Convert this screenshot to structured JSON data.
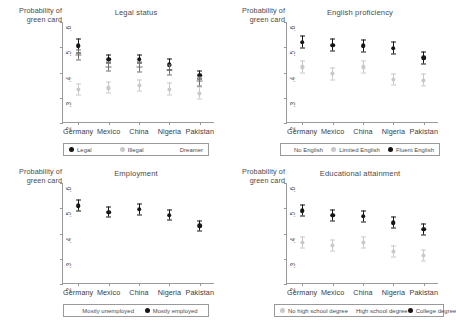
{
  "figure": {
    "ylabel": "Probability of\ngreen card",
    "countries": [
      "Germany",
      "Mexico",
      "China",
      "Nigeria",
      "Pakistan"
    ],
    "yticks": [
      ".6",
      ".5",
      ".4",
      ".3",
      ".2"
    ],
    "colors": {
      "dark": "#161616",
      "mid": "#8f8f8f",
      "light": "#c9c9c9",
      "axis": "#9a9a9a",
      "text": "#4a4a4a"
    }
  },
  "panels": [
    {
      "id": "legal-status",
      "title": "Legal status",
      "legend": [
        {
          "label": "Legal",
          "style": "solid"
        },
        {
          "label": "Illegal",
          "style": "light"
        },
        {
          "label": "Dreamer",
          "style": "none"
        }
      ]
    },
    {
      "id": "english-proficiency",
      "title": "English proficiency",
      "legend": [
        {
          "label": "No English",
          "style": "none"
        },
        {
          "label": "Limited English",
          "style": "light"
        },
        {
          "label": "Fluent English",
          "style": "solid"
        }
      ]
    },
    {
      "id": "employment",
      "title": "Employment",
      "legend": [
        {
          "label": "Mostly unemployed",
          "style": "none"
        },
        {
          "label": "Mostly employed",
          "style": "solid"
        }
      ]
    },
    {
      "id": "educational-attainment",
      "title": "Educational attainment",
      "legend": [
        {
          "label": "No high school degree",
          "style": "light"
        },
        {
          "label": "High school degree",
          "style": "none"
        },
        {
          "label": "College degree",
          "style": "solid"
        }
      ]
    }
  ],
  "chart_data": [
    {
      "type": "scatter",
      "id": "legal-status",
      "title": "Legal status",
      "xlabel": "",
      "ylabel": "Probability of green card",
      "ylim": [
        0.2,
        0.6
      ],
      "yticks": [
        0.2,
        0.3,
        0.4,
        0.5,
        0.6
      ],
      "grid": false,
      "legend_position": "bottom",
      "categories": [
        "Germany",
        "Mexico",
        "China",
        "Nigeria",
        "Pakistan"
      ],
      "series": [
        {
          "name": "Legal",
          "marker": "solid-circle",
          "values": [
            0.505,
            0.452,
            0.452,
            0.432,
            0.389
          ],
          "ci_low": [
            0.478,
            0.436,
            0.436,
            0.41,
            0.373
          ],
          "ci_high": [
            0.534,
            0.47,
            0.468,
            0.455,
            0.406
          ]
        },
        {
          "name": "Illegal",
          "marker": "light-circle",
          "values": [
            0.332,
            0.339,
            0.349,
            0.334,
            0.318
          ],
          "ci_low": [
            0.309,
            0.317,
            0.327,
            0.31,
            0.295
          ],
          "ci_high": [
            0.356,
            0.362,
            0.372,
            0.358,
            0.341
          ]
        },
        {
          "name": "Dreamer",
          "marker": "dash",
          "values": [
            0.47,
            0.423,
            0.421,
            0.41,
            0.365
          ],
          "ci_low": [
            0.45,
            0.405,
            0.402,
            0.392,
            0.348
          ],
          "ci_high": [
            0.49,
            0.442,
            0.44,
            0.428,
            0.383
          ]
        }
      ]
    },
    {
      "type": "scatter",
      "id": "english-proficiency",
      "title": "English proficiency",
      "xlabel": "",
      "ylabel": "Probability of green card",
      "ylim": [
        0.2,
        0.6
      ],
      "yticks": [
        0.2,
        0.3,
        0.4,
        0.5,
        0.6
      ],
      "grid": false,
      "legend_position": "bottom",
      "categories": [
        "Germany",
        "Mexico",
        "China",
        "Nigeria",
        "Pakistan"
      ],
      "series": [
        {
          "name": "No English",
          "marker": "reference",
          "values": [
            null,
            null,
            null,
            null,
            null
          ],
          "ci_low": [
            null,
            null,
            null,
            null,
            null
          ],
          "ci_high": [
            null,
            null,
            null,
            null,
            null
          ]
        },
        {
          "name": "Limited English",
          "marker": "light-circle",
          "values": [
            0.422,
            0.395,
            0.422,
            0.372,
            0.37
          ],
          "ci_low": [
            0.398,
            0.372,
            0.399,
            0.349,
            0.346
          ],
          "ci_high": [
            0.446,
            0.418,
            0.445,
            0.396,
            0.394
          ]
        },
        {
          "name": "Fluent English",
          "marker": "solid-circle",
          "values": [
            0.52,
            0.508,
            0.505,
            0.496,
            0.458
          ],
          "ci_low": [
            0.497,
            0.485,
            0.482,
            0.472,
            0.434
          ],
          "ci_high": [
            0.543,
            0.531,
            0.528,
            0.52,
            0.482
          ]
        }
      ]
    },
    {
      "type": "scatter",
      "id": "employment",
      "title": "Employment",
      "xlabel": "",
      "ylabel": "Probability of green card",
      "ylim": [
        0.2,
        0.6
      ],
      "yticks": [
        0.2,
        0.3,
        0.4,
        0.5,
        0.6
      ],
      "grid": false,
      "legend_position": "bottom",
      "categories": [
        "Germany",
        "Mexico",
        "China",
        "Nigeria",
        "Pakistan"
      ],
      "series": [
        {
          "name": "Mostly unemployed",
          "marker": "reference",
          "values": [
            null,
            null,
            null,
            null,
            null
          ],
          "ci_low": [
            null,
            null,
            null,
            null,
            null
          ],
          "ci_high": [
            null,
            null,
            null,
            null,
            null
          ]
        },
        {
          "name": "Mostly employed",
          "marker": "solid-circle",
          "values": [
            0.51,
            0.485,
            0.496,
            0.473,
            0.43
          ],
          "ci_low": [
            0.489,
            0.464,
            0.475,
            0.452,
            0.409
          ],
          "ci_high": [
            0.531,
            0.506,
            0.517,
            0.494,
            0.451
          ]
        }
      ]
    },
    {
      "type": "scatter",
      "id": "educational-attainment",
      "title": "Educational attainment",
      "xlabel": "",
      "ylabel": "Probability of green card",
      "ylim": [
        0.2,
        0.6
      ],
      "yticks": [
        0.2,
        0.3,
        0.4,
        0.5,
        0.6
      ],
      "grid": false,
      "legend_position": "bottom",
      "categories": [
        "Germany",
        "Mexico",
        "China",
        "Nigeria",
        "Pakistan"
      ],
      "series": [
        {
          "name": "No high school degree",
          "marker": "light-circle",
          "values": [
            0.366,
            0.353,
            0.364,
            0.328,
            0.314
          ],
          "ci_low": [
            0.344,
            0.331,
            0.342,
            0.306,
            0.292
          ],
          "ci_high": [
            0.388,
            0.375,
            0.386,
            0.35,
            0.336
          ]
        },
        {
          "name": "High school degree",
          "marker": "reference",
          "values": [
            null,
            null,
            null,
            null,
            null
          ],
          "ci_low": [
            null,
            null,
            null,
            null,
            null
          ],
          "ci_high": [
            null,
            null,
            null,
            null,
            null
          ]
        },
        {
          "name": "College degree",
          "marker": "solid-circle",
          "values": [
            0.49,
            0.472,
            0.468,
            0.443,
            0.417
          ],
          "ci_low": [
            0.468,
            0.45,
            0.445,
            0.42,
            0.395
          ],
          "ci_high": [
            0.512,
            0.494,
            0.491,
            0.467,
            0.439
          ]
        }
      ]
    }
  ]
}
